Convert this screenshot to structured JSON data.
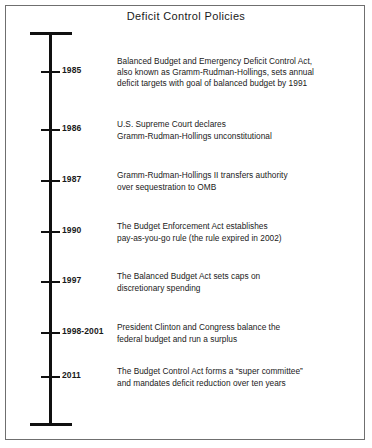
{
  "figure": {
    "title": "Deficit Control Policies",
    "frame_color": "#6f6f6f",
    "axis_color": "#101010",
    "text_color": "#1a1a1a"
  },
  "chart_data": {
    "type": "timeline",
    "title": "Deficit Control Policies",
    "orientation": "vertical",
    "axis_start_cap": true,
    "axis_end_cap": true,
    "events": [
      {
        "year": "1985",
        "y": 72,
        "lines": [
          "Balanced Budget and Emergency Deficit Control Act,",
          "also known as Gramm-Rudman-Hollings, sets annual",
          "deficit targets with goal of balanced budget by 1991"
        ]
      },
      {
        "year": "1986",
        "y": 130,
        "lines": [
          "U.S. Supreme Court declares",
          "Gramm-Rudman-Hollings unconstitutional"
        ]
      },
      {
        "year": "1987",
        "y": 181,
        "lines": [
          "Gramm-Rudman-Hollings II transfers authority",
          "over sequestration to OMB"
        ]
      },
      {
        "year": "1990",
        "y": 232,
        "lines": [
          "The Budget Enforcement Act establishes",
          "pay-as-you-go rule (the rule expired in 2002)"
        ]
      },
      {
        "year": "1997",
        "y": 282,
        "lines": [
          "The Balanced Budget Act sets caps on",
          "discretionary spending"
        ]
      },
      {
        "year": "1998-2001",
        "y": 333,
        "lines": [
          "President Clinton and Congress balance the",
          "federal budget and run a surplus"
        ]
      },
      {
        "year": "2011",
        "y": 377,
        "lines": [
          "The Budget Control Act forms a “super committee”",
          "and mandates deficit reduction over ten years"
        ]
      }
    ]
  }
}
